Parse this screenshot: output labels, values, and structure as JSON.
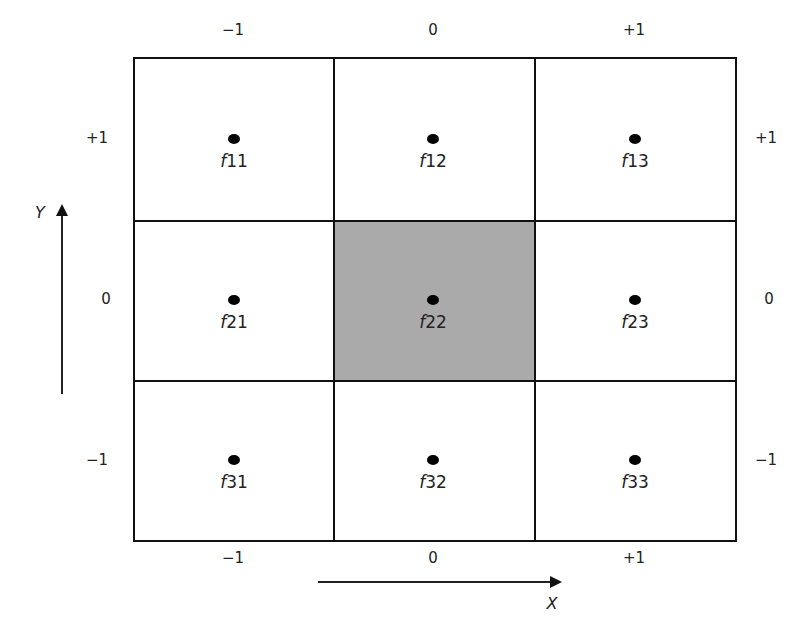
{
  "diagram": {
    "top_x_labels": [
      "−1",
      "0",
      "+1"
    ],
    "bottom_x_labels": [
      "−1",
      "0",
      "+1"
    ],
    "left_y_labels": [
      "+1",
      "0",
      "−1"
    ],
    "right_y_labels": [
      "+1",
      "0",
      "−1"
    ],
    "x_axis_label": "X",
    "y_axis_label": "Y",
    "highlight_cell": "f22",
    "highlight_color": "#aaaaaa",
    "cells": [
      {
        "prefix": "f",
        "index": "11"
      },
      {
        "prefix": "f",
        "index": "12"
      },
      {
        "prefix": "f",
        "index": "13"
      },
      {
        "prefix": "f",
        "index": "21"
      },
      {
        "prefix": "f",
        "index": "22"
      },
      {
        "prefix": "f",
        "index": "23"
      },
      {
        "prefix": "f",
        "index": "31"
      },
      {
        "prefix": "f",
        "index": "32"
      },
      {
        "prefix": "f",
        "index": "33"
      }
    ]
  }
}
